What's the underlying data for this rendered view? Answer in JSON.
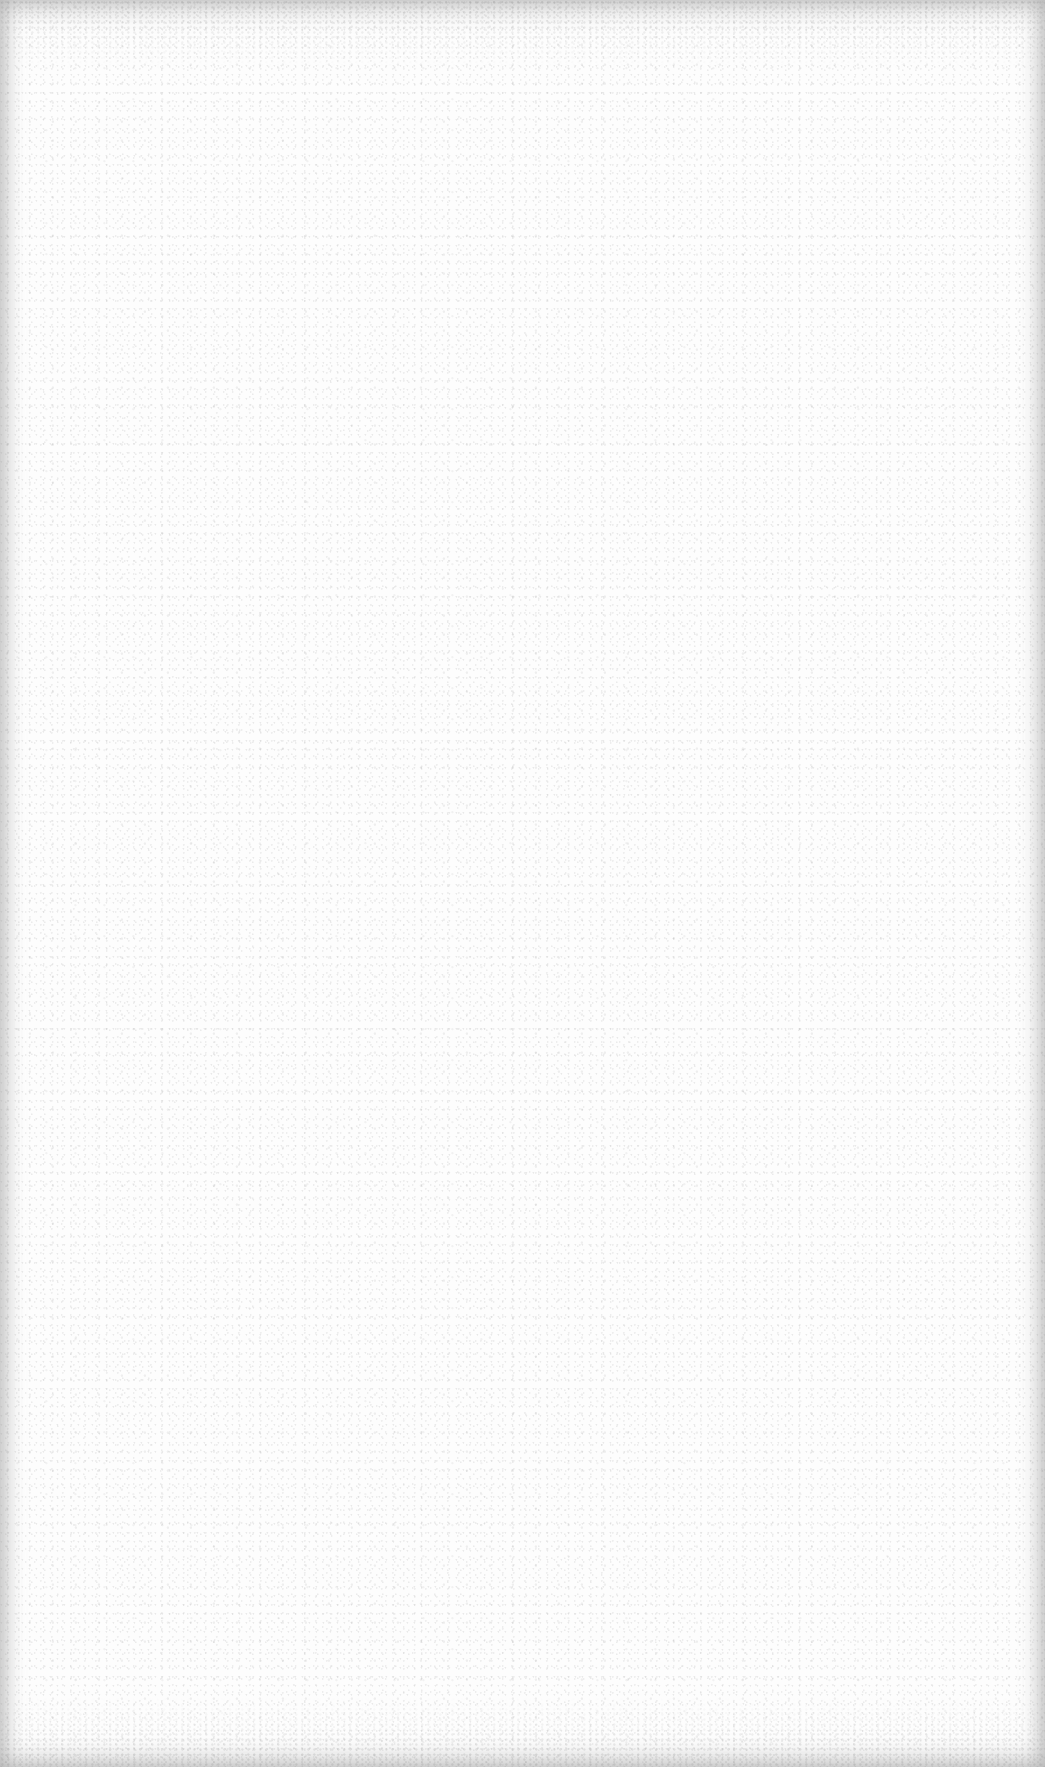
{
  "page": {
    "type": "blank-paper-sheet",
    "content": "",
    "colors": {
      "paper": "#fdfdfd",
      "grain": "#a0a0a0",
      "edge_shadow": "#aaaaaa"
    }
  }
}
